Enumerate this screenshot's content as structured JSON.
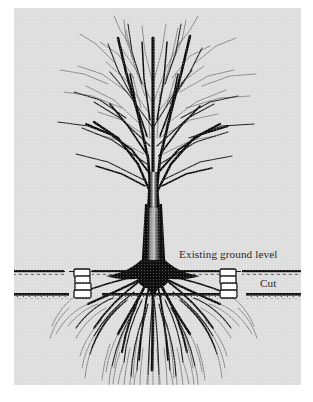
{
  "figure": {
    "kind": "line-illustration",
    "plate_background_color": "#dedede",
    "page_background_color": "#ffffff",
    "ink_color": "#111111"
  },
  "labels": {
    "existing_ground_level": "Existing ground level",
    "cut": "Cut"
  },
  "annotations": {
    "existing_ground_line": {
      "style": "dashed",
      "color": "#1a1a1a",
      "y": 263
    },
    "cut_grade_line": {
      "style": "solid-stippled",
      "color": "#111111",
      "y": 286
    }
  },
  "markers": [
    {
      "name": "grade-stake-left",
      "x": 62,
      "blocks": 4,
      "fill": "#ffffff",
      "stroke": "#111111"
    },
    {
      "name": "grade-stake-right",
      "x": 210,
      "blocks": 4,
      "fill": "#ffffff",
      "stroke": "#111111"
    }
  ],
  "tree": {
    "trunk_color": "#141414",
    "canopy_branch_color": "#1c1c1c",
    "root_color": "#141414",
    "trunk_center_x": 139,
    "ground_contact_y": 265
  }
}
